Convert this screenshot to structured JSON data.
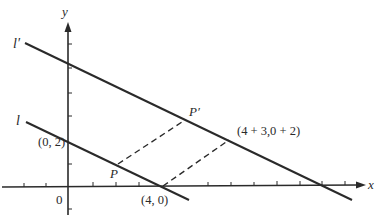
{
  "diagram": {
    "axes": {
      "x_label": "x",
      "y_label": "y",
      "origin_label": "0"
    },
    "lines": [
      {
        "name": "l",
        "label": "l"
      },
      {
        "name": "l-prime",
        "label": "l′"
      }
    ],
    "points": {
      "y_intercept_label": "(0, 2)",
      "x_intercept_label": "(4, 0)",
      "translated_point_label": "(4 + 3,0 + 2)",
      "p_label": "P",
      "p_prime_label": "P′"
    },
    "colors": {
      "ink": "#2a2a2a",
      "background": "#ffffff"
    }
  }
}
